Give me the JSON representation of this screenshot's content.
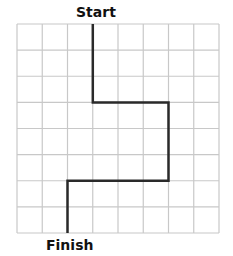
{
  "labels": {
    "start": "Start",
    "finish": "Finish"
  },
  "grid": {
    "columns": 8,
    "rows": 8,
    "left": 17,
    "top": 24,
    "right": 219,
    "bottom": 233,
    "line_color": "#c8c8c8",
    "path_color": "#2a2a2a"
  },
  "path": {
    "description": "Start at top of column line 3, go down 3 squares, right 3 squares, down 3 squares, left 4 squares, down 2 squares to Finish",
    "points_grid": [
      [
        3,
        0
      ],
      [
        3,
        3
      ],
      [
        6,
        3
      ],
      [
        6,
        6
      ],
      [
        2,
        6
      ],
      [
        2,
        8
      ]
    ],
    "moves": [
      {
        "direction": "down",
        "squares": 3
      },
      {
        "direction": "right",
        "squares": 3
      },
      {
        "direction": "down",
        "squares": 3
      },
      {
        "direction": "left",
        "squares": 4
      },
      {
        "direction": "down",
        "squares": 2
      }
    ]
  }
}
